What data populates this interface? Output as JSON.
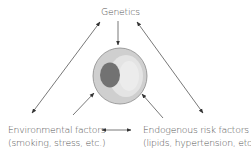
{
  "diagram": {
    "top_node": {
      "label": "Genetics"
    },
    "left_node": {
      "line1": "Environmental factors",
      "line2": "(smoking, stress, etc.)"
    },
    "right_node": {
      "line1": "Endogenous risk factors",
      "line2": "(lipids, hypertension, etc.)"
    },
    "center": {
      "icon": "cell-icon",
      "description": "cell with nucleus"
    },
    "colors": {
      "arrow": "#333333",
      "cell_outer": "#d0d0d0",
      "cell_inner": "#e6e6e6",
      "nucleus": "#707070",
      "cell_stroke": "#8a8a8a"
    },
    "edges": [
      {
        "from": "Genetics",
        "to": "cell",
        "type": "single"
      },
      {
        "from": "Genetics",
        "to": "Environmental factors",
        "type": "double"
      },
      {
        "from": "Genetics",
        "to": "Endogenous risk factors",
        "type": "double"
      },
      {
        "from": "Environmental factors",
        "to": "cell",
        "type": "single"
      },
      {
        "from": "Endogenous risk factors",
        "to": "cell",
        "type": "single"
      },
      {
        "from": "Environmental factors",
        "to": "Endogenous risk factors",
        "type": "double"
      }
    ]
  }
}
